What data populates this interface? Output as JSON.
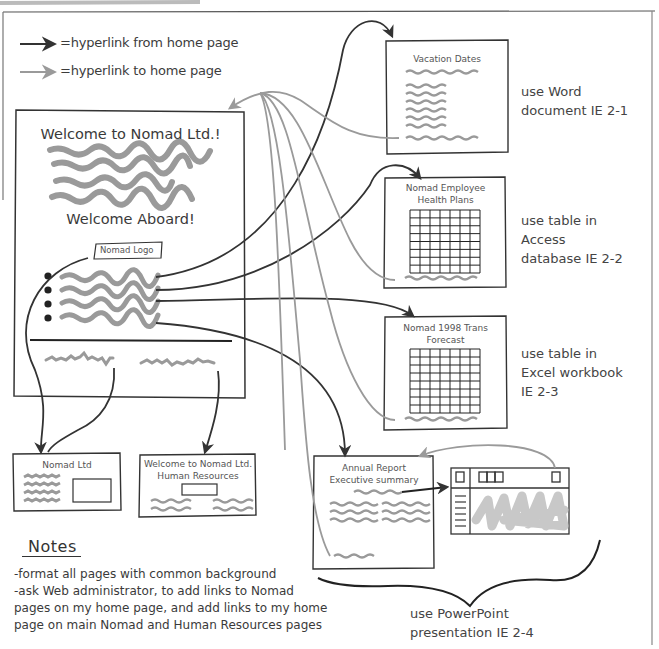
{
  "header": {
    "caption_cutoff": "...'s Web page sketch"
  },
  "legend": {
    "items": [
      {
        "label": "=hyperlink from home page",
        "color": "#3a3a3a"
      },
      {
        "label": "=hyperlink to home page",
        "color": "#9a9a9a"
      }
    ]
  },
  "home_page": {
    "title": "Welcome to Nomad Ltd.!",
    "subtitle": "Welcome Aboard!",
    "logo_label": "Nomad Logo",
    "bullet_count": 4
  },
  "linked_pages": {
    "vacation": {
      "title": "Vacation Dates",
      "note": "use Word\ndocument IE 2-1"
    },
    "health": {
      "title_line1": "Nomad Employee",
      "title_line2": "Health Plans",
      "note": "use table in\nAccess\ndatabase IE 2-2",
      "grid": {
        "cols": 7,
        "rows": 8
      }
    },
    "forecast": {
      "title_line1": "Nomad 1998 Trans",
      "title_line2": "Forecast",
      "note": "use table in\nExcel workbook\nIE 2-3",
      "grid": {
        "cols": 7,
        "rows": 8
      }
    },
    "annual": {
      "title_line1": "Annual Report",
      "title_line2": "Executive summary",
      "note": "use PowerPoint\npresentation IE 2-4"
    }
  },
  "external_pages": {
    "nomad_ltd": {
      "title": "Nomad Ltd"
    },
    "hr": {
      "title_line1": "Welcome to Nomad Ltd.",
      "title_line2": "Human Resources"
    }
  },
  "notes": {
    "heading": "Notes",
    "lines": [
      "-format all pages with common background",
      "-ask Web administrator, to add links to Nomad",
      "pages on my home page, and add links to my home",
      "page on main Nomad and Human Resources pages"
    ]
  },
  "colors": {
    "ink": "#333333",
    "link_from": "#3a3a3a",
    "link_to": "#9a9a9a",
    "scribble": "#9e9e9e",
    "fill_scribble": "#c8c8c8"
  }
}
